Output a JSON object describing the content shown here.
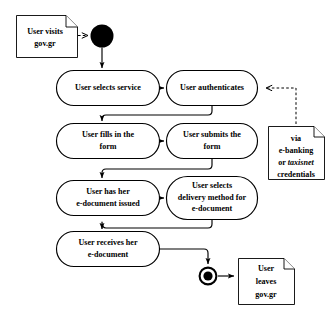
{
  "diagram": {
    "type": "uml-activity-diagram",
    "background_color": "#ffffff",
    "stroke_color": "#000000",
    "initial_node": {
      "name": "initial-node",
      "cx": 102,
      "cy": 36,
      "r": 11.5
    },
    "final_node": {
      "name": "final-node",
      "cx": 208,
      "cy": 276,
      "outer_r": 9.5,
      "inner_r": 4.6
    },
    "activities": [
      {
        "id": "select-service",
        "lines": [
          "User selects service"
        ],
        "x": 56,
        "y": 70,
        "w": 104,
        "h": 36
      },
      {
        "id": "authenticate",
        "lines": [
          "User authenticates"
        ],
        "x": 166,
        "y": 70,
        "w": 92,
        "h": 36
      },
      {
        "id": "fill-form",
        "lines": [
          "User fills in the",
          "form"
        ],
        "x": 56,
        "y": 123,
        "w": 104,
        "h": 36
      },
      {
        "id": "submit-form",
        "lines": [
          "User submits the",
          "form"
        ],
        "x": 166,
        "y": 123,
        "w": 92,
        "h": 36
      },
      {
        "id": "document-issued",
        "lines": [
          "User has her",
          "e-document issued"
        ],
        "x": 56,
        "y": 180,
        "w": 104,
        "h": 36
      },
      {
        "id": "select-delivery",
        "lines": [
          "User selects",
          "delivery method for",
          "e-document"
        ],
        "x": 166,
        "y": 176,
        "w": 92,
        "h": 44
      },
      {
        "id": "receives-document",
        "lines": [
          "User receives her",
          "e-document"
        ],
        "x": 56,
        "y": 231,
        "w": 104,
        "h": 36
      }
    ],
    "notes": [
      {
        "id": "note-visits",
        "lines": [
          "User visits",
          "gov.gr"
        ],
        "x": 16,
        "y": 15,
        "w": 62,
        "h": 43,
        "fold": 12
      },
      {
        "id": "note-credentials",
        "lines": [
          "via",
          "e-banking",
          "or taxisnet",
          "credentials"
        ],
        "italic_word": "taxisnet",
        "x": 268,
        "y": 126,
        "w": 57,
        "h": 54,
        "fold": 11
      },
      {
        "id": "note-leaves",
        "lines": [
          "User",
          "leaves",
          "gov.gr"
        ],
        "x": 238,
        "y": 258,
        "w": 57,
        "h": 47,
        "fold": 11
      }
    ],
    "edges": [
      {
        "id": "edge-start-to-select-service",
        "style": "solid"
      },
      {
        "id": "edge-select-service-to-authenticate",
        "style": "solid"
      },
      {
        "id": "edge-authenticate-to-fill-form",
        "style": "solid"
      },
      {
        "id": "edge-fill-form-to-submit-form",
        "style": "solid"
      },
      {
        "id": "edge-submit-form-to-document-issued",
        "style": "solid"
      },
      {
        "id": "edge-document-issued-to-select-delivery",
        "style": "solid"
      },
      {
        "id": "edge-select-delivery-to-receives-document",
        "style": "solid"
      },
      {
        "id": "edge-receives-document-to-final",
        "style": "solid"
      },
      {
        "id": "anchor-note-visits-to-initial",
        "style": "dashed"
      },
      {
        "id": "anchor-note-credentials-to-authenticate",
        "style": "dashed"
      },
      {
        "id": "edge-final-to-note-leaves",
        "style": "solid"
      }
    ]
  }
}
